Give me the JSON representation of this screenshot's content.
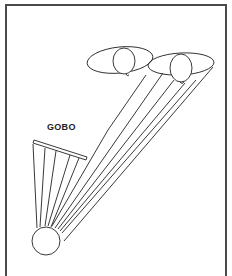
{
  "diagram": {
    "labels": {
      "gobo": "GOBO"
    },
    "elements": [
      "light-source",
      "gobo",
      "light-rays",
      "person-left",
      "person-right",
      "frame-border"
    ],
    "colors": {
      "line": "#222222",
      "background": "#ffffff",
      "frame": "#4a4a4a"
    }
  }
}
